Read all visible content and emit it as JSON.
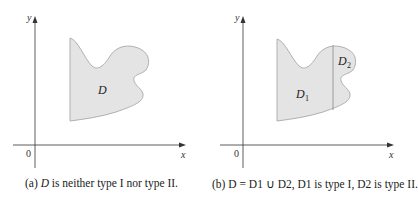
{
  "panels": [
    {
      "id": "a",
      "axes": {
        "x_label": "x",
        "y_label": "y",
        "origin_label": "0"
      },
      "region_labels": [
        "D"
      ],
      "caption": {
        "prefix": "(a) ",
        "var": "D",
        "rest": " is neither type I nor type II."
      }
    },
    {
      "id": "b",
      "axes": {
        "x_label": "x",
        "y_label": "y",
        "origin_label": "0"
      },
      "region_labels": [
        "D",
        "1",
        "D",
        "2"
      ],
      "caption": {
        "prefix": "(b)  ",
        "text": "D = D1 ∪ D2, D1 is type I, D2 is type II."
      }
    }
  ],
  "colors": {
    "region_fill": "#e4e4e4",
    "region_stroke": "#b0b0b0",
    "axis": "#333333",
    "divider": "#888888"
  }
}
